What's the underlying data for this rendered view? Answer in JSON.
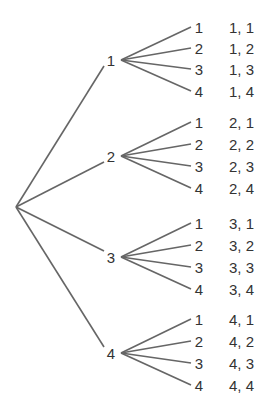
{
  "diagram": {
    "type": "tree",
    "root": {
      "x": 16,
      "y": 207
    },
    "branches": [
      {
        "label": "1",
        "y": 60,
        "leaves": [
          {
            "label": "1",
            "outcome": "1, 1",
            "y": 27
          },
          {
            "label": "2",
            "outcome": "1, 2",
            "y": 48
          },
          {
            "label": "3",
            "outcome": "1, 3",
            "y": 69
          },
          {
            "label": "4",
            "outcome": "1, 4",
            "y": 91
          }
        ]
      },
      {
        "label": "2",
        "y": 156,
        "leaves": [
          {
            "label": "1",
            "outcome": "2, 1",
            "y": 122
          },
          {
            "label": "2",
            "outcome": "2, 2",
            "y": 144
          },
          {
            "label": "3",
            "outcome": "2, 3",
            "y": 166
          },
          {
            "label": "4",
            "outcome": "2, 4",
            "y": 188
          }
        ]
      },
      {
        "label": "3",
        "y": 257,
        "leaves": [
          {
            "label": "1",
            "outcome": "3, 1",
            "y": 223
          },
          {
            "label": "2",
            "outcome": "3, 2",
            "y": 245
          },
          {
            "label": "3",
            "outcome": "3, 3",
            "y": 267
          },
          {
            "label": "4",
            "outcome": "3, 4",
            "y": 289
          }
        ]
      },
      {
        "label": "4",
        "y": 353,
        "leaves": [
          {
            "label": "1",
            "outcome": "4, 1",
            "y": 319
          },
          {
            "label": "2",
            "outcome": "4, 2",
            "y": 341
          },
          {
            "label": "3",
            "outcome": "4, 3",
            "y": 363
          },
          {
            "label": "4",
            "outcome": "4, 4",
            "y": 385
          }
        ]
      }
    ]
  }
}
